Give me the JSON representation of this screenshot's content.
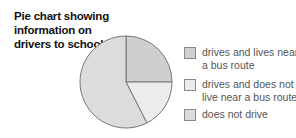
{
  "chart_data": {
    "type": "pie",
    "title": "Pie chart showing information on drivers to school",
    "categories": [
      "drives and lives near a bus route",
      "drives and does not live near a bus route",
      "does not drive"
    ],
    "values": [
      25,
      17.5,
      57.5
    ],
    "colors": [
      "#cfcfcf",
      "#ececec",
      "#dcdcdc"
    ],
    "legend_position": "right"
  },
  "title": "Pie chart showing information on drivers to school",
  "legend": [
    {
      "label": "drives and lives near a bus route",
      "color": "#cfcfcf"
    },
    {
      "label": "drives and does not live near a bus route",
      "color": "#ececec"
    },
    {
      "label": "does not drive",
      "color": "#dcdcdc"
    }
  ]
}
